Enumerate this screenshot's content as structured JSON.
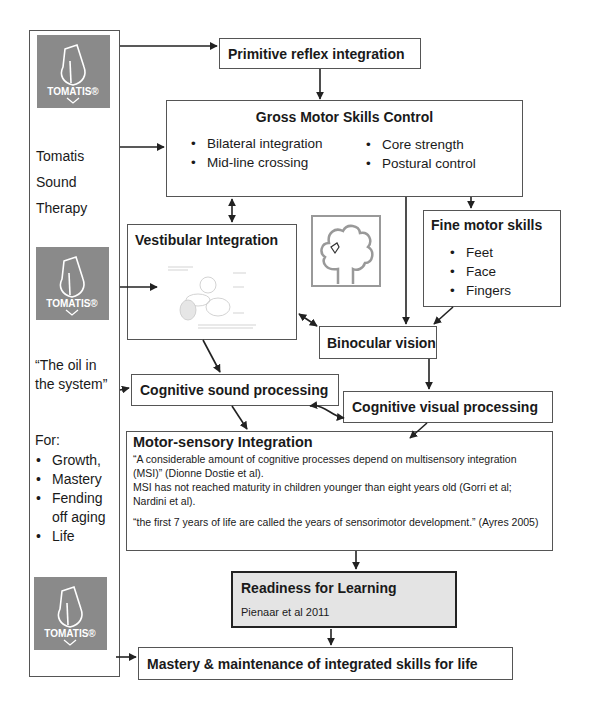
{
  "left_panel": {
    "logo_text": "TOMATIS®",
    "therapy_lines": [
      "Tomatis",
      "Sound",
      "Therapy"
    ],
    "quote": [
      "“The oil in",
      "the system”"
    ],
    "for_label": "For:",
    "for_items": [
      "Growth,",
      "Mastery",
      "Fending off aging",
      "Life"
    ]
  },
  "nodes": {
    "primitive_reflex": {
      "title": "Primitive reflex integration"
    },
    "gross_motor": {
      "title": "Gross Motor Skills Control",
      "items_left": [
        "Bilateral integration",
        "Mid-line crossing"
      ],
      "items_right": [
        "Core strength",
        "Postural control"
      ]
    },
    "vestibular": {
      "title": "Vestibular Integration",
      "image": "inner-ear-illustration"
    },
    "tree_icon": "tree-drawing-icon",
    "fine_motor": {
      "title": "Fine motor skills",
      "items": [
        "Feet",
        "Face",
        "Fingers"
      ]
    },
    "binocular": {
      "title": "Binocular vision"
    },
    "cog_sound": {
      "title": "Cognitive sound processing"
    },
    "cog_visual": {
      "title": "Cognitive visual processing"
    },
    "motor_sensory": {
      "title": "Motor-sensory Integration",
      "para1": "“A considerable amount of cognitive processes depend on multisensory integration (MSI)” (Dionne Dostie et al).",
      "para2": "MSI has not reached maturity in children younger than eight years old (Gorri et al; Nardini et al).",
      "para3": "“the first 7 years of life are called the years of sensorimotor development.” (Ayres 2005)"
    },
    "readiness": {
      "title": "Readiness for Learning",
      "citation": "Pienaar et al 2011",
      "fill": "#e4e4e4"
    },
    "mastery": {
      "title": "Mastery & maintenance of integrated skills for life"
    }
  },
  "colors": {
    "logo_bg": "#8a8a8a",
    "line": "#333333",
    "border": "#555555"
  }
}
